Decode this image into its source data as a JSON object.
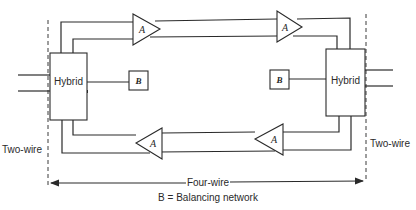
{
  "diagram": {
    "left_hybrid": {
      "label": "Hybrid"
    },
    "right_hybrid": {
      "label": "Hybrid"
    },
    "left_balancing": {
      "label": "B"
    },
    "right_balancing": {
      "label": "B"
    },
    "amplifiers": {
      "top_left": {
        "label": "A",
        "direction": "right"
      },
      "top_right": {
        "label": "A",
        "direction": "right"
      },
      "bottom_left": {
        "label": "A",
        "direction": "left"
      },
      "bottom_right": {
        "label": "A",
        "direction": "left"
      }
    },
    "left_side_label": "Two-wire",
    "right_side_label": "Two-wire",
    "span_label": "Four-wire",
    "legend": "B = Balancing network"
  }
}
